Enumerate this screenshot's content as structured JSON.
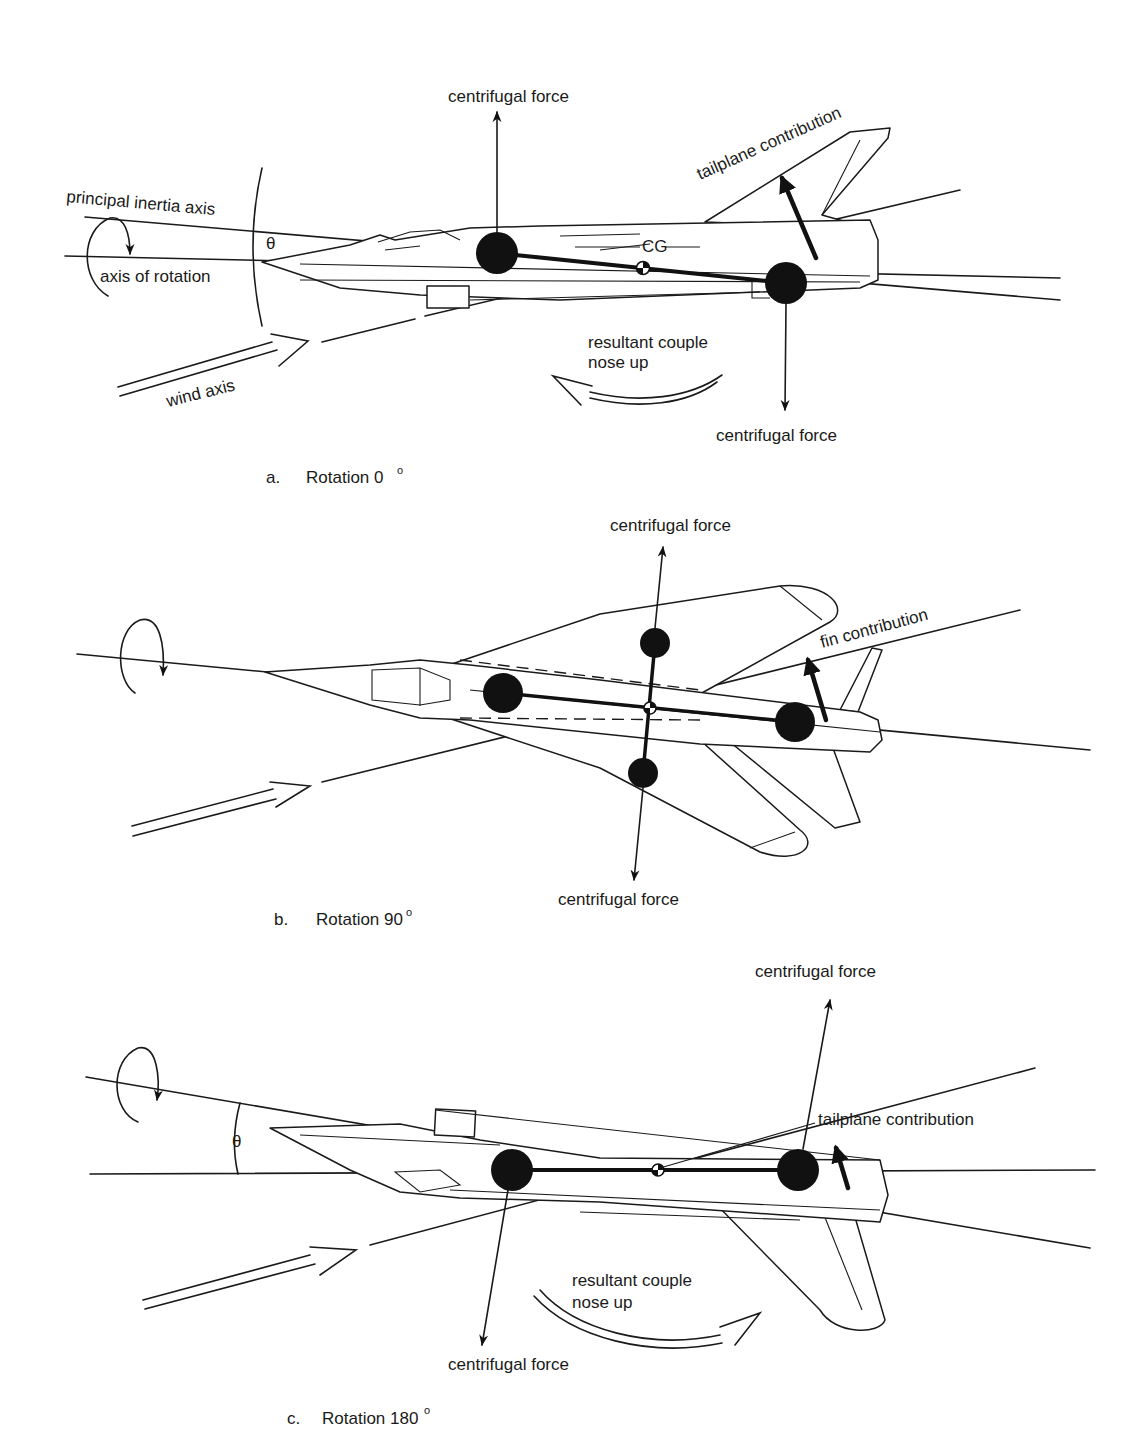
{
  "panels": [
    {
      "id": "a",
      "caption_letter": "a.",
      "caption_text": "Rotation 0",
      "caption_degree": "o",
      "labels": {
        "centrifugal_force_top": "centrifugal force",
        "centrifugal_force_bottom": "centrifugal force",
        "tailplane_contribution": "tailplane contribution",
        "principal_inertia_axis": "principal inertia axis",
        "axis_of_rotation": "axis of rotation",
        "theta": "θ",
        "cg": "CG",
        "resultant_couple_line1": "resultant couple",
        "resultant_couple_line2": "nose up",
        "wind_axis": "wind axis"
      }
    },
    {
      "id": "b",
      "caption_letter": "b.",
      "caption_text": "Rotation 90",
      "caption_degree": "o",
      "labels": {
        "centrifugal_force_top": "centrifugal force",
        "centrifugal_force_bottom": "centrifugal force",
        "fin_contribution": "fin contribution"
      }
    },
    {
      "id": "c",
      "caption_letter": "c.",
      "caption_text": "Rotation 180",
      "caption_degree": "o",
      "labels": {
        "centrifugal_force_top": "centrifugal force",
        "centrifugal_force_bottom": "centrifugal force",
        "tailplane_contribution": "tailplane contribution",
        "theta": "θ",
        "resultant_couple_line1": "resultant couple",
        "resultant_couple_line2": "nose up"
      }
    }
  ],
  "colors": {
    "ink": "#1a1a1a",
    "paper": "#ffffff"
  }
}
